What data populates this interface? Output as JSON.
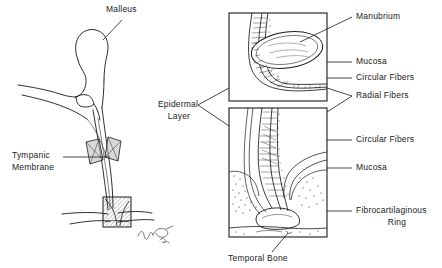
{
  "figure": {
    "background_color": "#ffffff",
    "ink_color": "#1a1a1a"
  },
  "labels": {
    "malleus": "Malleus",
    "tympanic_membrane_line1": "Tympanic",
    "tympanic_membrane_line2": "Membrane",
    "epidermal_layer_line1": "Epidermal",
    "epidermal_layer_line2": "Layer",
    "manubrium": "Manubrium",
    "mucosa_upper": "Mucosa",
    "circular_fibers_upper": "Circular Fibers",
    "radial_fibers": "Radial Fibers",
    "circular_fibers_lower": "Circular Fibers",
    "mucosa_lower": "Mucosa",
    "fibrocartilaginous_ring_line1": "Fibrocartilaginous",
    "fibrocartilaginous_ring_line2": "Ring",
    "temporal_bone": "Temporal Bone"
  },
  "panels": {
    "upper_inset_name": "upper-histology-inset",
    "lower_inset_name": "lower-histology-inset"
  },
  "annotations": {
    "signature": "artist signature monogram"
  }
}
